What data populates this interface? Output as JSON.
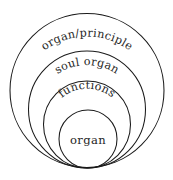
{
  "diagram": {
    "type": "nested-circles",
    "background_color": "#ffffff",
    "stroke_color": "#1a1a1a",
    "text_color": "#262626",
    "tangent_point": {
      "x": 87,
      "y": 168
    },
    "levels": [
      {
        "id": "organ-principle",
        "label": "organ/principle",
        "depth": 1,
        "label_style": "arched",
        "circle": {
          "cx": 87,
          "cy": 90.5,
          "r": 77
        }
      },
      {
        "id": "soul-organ",
        "label": "soul organ",
        "depth": 2,
        "label_style": "arched",
        "circle": {
          "cx": 87,
          "cy": 109.5,
          "r": 58.5
        }
      },
      {
        "id": "functions",
        "label": "functions",
        "depth": 3,
        "label_style": "arched",
        "circle": {
          "cx": 87,
          "cy": 124.5,
          "r": 43.5
        }
      },
      {
        "id": "organ",
        "label": "organ",
        "depth": 4,
        "label_style": "horizontal",
        "circle": {
          "cx": 88,
          "cy": 139,
          "r": 29
        }
      }
    ]
  }
}
